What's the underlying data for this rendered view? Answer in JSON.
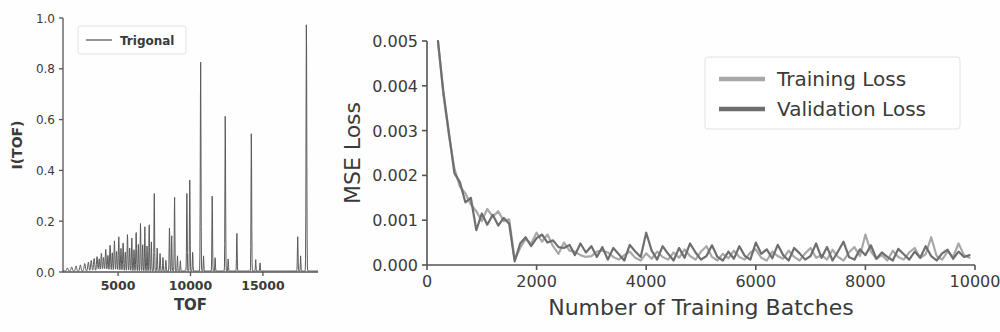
{
  "figure": {
    "background_color": "#fefefe",
    "text_color": "#3a3a3a"
  },
  "chart_data": [
    {
      "id": "tof-spectrum",
      "type": "line",
      "title": "",
      "xlabel": "TOF",
      "ylabel": "I(TOF)",
      "xlim": [
        1200,
        18800
      ],
      "ylim": [
        0.0,
        1.0
      ],
      "xticks": [
        5000,
        10000,
        15000
      ],
      "xtick_labels": [
        "5000",
        "10000",
        "15000"
      ],
      "yticks": [
        0.0,
        0.2,
        0.4,
        0.6,
        0.8,
        1.0
      ],
      "ytick_labels": [
        "0.0",
        "0.2",
        "0.4",
        "0.6",
        "0.8",
        "1.0"
      ],
      "grid": false,
      "legend_position": "upper left",
      "series": [
        {
          "name": "Trigonal",
          "color": "#5a5a5a",
          "linewidth": 1.0,
          "peaks": [
            {
              "x": 1500,
              "h": 0.012,
              "w": 60
            },
            {
              "x": 1800,
              "h": 0.016,
              "w": 60
            },
            {
              "x": 2100,
              "h": 0.02,
              "w": 60
            },
            {
              "x": 2400,
              "h": 0.024,
              "w": 60
            },
            {
              "x": 2700,
              "h": 0.03,
              "w": 60
            },
            {
              "x": 2950,
              "h": 0.035,
              "w": 55
            },
            {
              "x": 3150,
              "h": 0.042,
              "w": 55
            },
            {
              "x": 3350,
              "h": 0.05,
              "w": 55
            },
            {
              "x": 3550,
              "h": 0.058,
              "w": 50
            },
            {
              "x": 3700,
              "h": 0.048,
              "w": 45
            },
            {
              "x": 3850,
              "h": 0.07,
              "w": 45
            },
            {
              "x": 4000,
              "h": 0.055,
              "w": 45
            },
            {
              "x": 4150,
              "h": 0.085,
              "w": 45
            },
            {
              "x": 4300,
              "h": 0.062,
              "w": 42
            },
            {
              "x": 4450,
              "h": 0.105,
              "w": 42
            },
            {
              "x": 4600,
              "h": 0.072,
              "w": 40
            },
            {
              "x": 4750,
              "h": 0.12,
              "w": 40
            },
            {
              "x": 4900,
              "h": 0.08,
              "w": 40
            },
            {
              "x": 5050,
              "h": 0.135,
              "w": 38
            },
            {
              "x": 5200,
              "h": 0.09,
              "w": 38
            },
            {
              "x": 5350,
              "h": 0.115,
              "w": 38
            },
            {
              "x": 5500,
              "h": 0.075,
              "w": 36
            },
            {
              "x": 5650,
              "h": 0.145,
              "w": 36
            },
            {
              "x": 5800,
              "h": 0.095,
              "w": 36
            },
            {
              "x": 5950,
              "h": 0.13,
              "w": 34
            },
            {
              "x": 6100,
              "h": 0.085,
              "w": 34
            },
            {
              "x": 6250,
              "h": 0.16,
              "w": 34
            },
            {
              "x": 6400,
              "h": 0.105,
              "w": 32
            },
            {
              "x": 6550,
              "h": 0.19,
              "w": 32
            },
            {
              "x": 6700,
              "h": 0.11,
              "w": 32
            },
            {
              "x": 6850,
              "h": 0.175,
              "w": 30
            },
            {
              "x": 7000,
              "h": 0.1,
              "w": 30
            },
            {
              "x": 7150,
              "h": 0.195,
              "w": 30
            },
            {
              "x": 7300,
              "h": 0.115,
              "w": 30
            },
            {
              "x": 7500,
              "h": 0.305,
              "w": 30
            },
            {
              "x": 7700,
              "h": 0.09,
              "w": 30
            },
            {
              "x": 7900,
              "h": 0.07,
              "w": 30
            },
            {
              "x": 8100,
              "h": 0.055,
              "w": 30
            },
            {
              "x": 8300,
              "h": 0.045,
              "w": 30
            },
            {
              "x": 8550,
              "h": 0.175,
              "w": 30
            },
            {
              "x": 8700,
              "h": 0.145,
              "w": 28
            },
            {
              "x": 8900,
              "h": 0.295,
              "w": 30
            },
            {
              "x": 9100,
              "h": 0.06,
              "w": 28
            },
            {
              "x": 9300,
              "h": 0.04,
              "w": 28
            },
            {
              "x": 9750,
              "h": 0.305,
              "w": 30
            },
            {
              "x": 9950,
              "h": 0.36,
              "w": 30
            },
            {
              "x": 10150,
              "h": 0.075,
              "w": 28
            },
            {
              "x": 10700,
              "h": 0.835,
              "w": 32
            },
            {
              "x": 10900,
              "h": 0.06,
              "w": 26
            },
            {
              "x": 11500,
              "h": 0.3,
              "w": 30
            },
            {
              "x": 11700,
              "h": 0.055,
              "w": 26
            },
            {
              "x": 12400,
              "h": 0.62,
              "w": 30
            },
            {
              "x": 12600,
              "h": 0.05,
              "w": 26
            },
            {
              "x": 13200,
              "h": 0.155,
              "w": 28
            },
            {
              "x": 14200,
              "h": 0.55,
              "w": 30
            },
            {
              "x": 14500,
              "h": 0.045,
              "w": 26
            },
            {
              "x": 14800,
              "h": 0.035,
              "w": 26
            },
            {
              "x": 17400,
              "h": 0.135,
              "w": 30
            },
            {
              "x": 17600,
              "h": 0.06,
              "w": 26
            },
            {
              "x": 18000,
              "h": 1.0,
              "w": 34
            }
          ]
        }
      ]
    },
    {
      "id": "training-loss",
      "type": "line",
      "title": "",
      "xlabel": "Number of Training Batches",
      "ylabel": "MSE Loss",
      "xlim": [
        0,
        10000
      ],
      "ylim": [
        0.0,
        0.005
      ],
      "xticks": [
        0,
        2000,
        4000,
        6000,
        8000,
        10000
      ],
      "xtick_labels": [
        "0",
        "2000",
        "4000",
        "6000",
        "8000",
        "10000"
      ],
      "yticks": [
        0.0,
        0.001,
        0.002,
        0.003,
        0.004,
        0.005
      ],
      "ytick_labels": [
        "0.000",
        "0.001",
        "0.002",
        "0.003",
        "0.004",
        "0.005"
      ],
      "grid": false,
      "legend_position": "upper right",
      "series": [
        {
          "name": "Training Loss",
          "color": "#a8a8a8",
          "linewidth": 2.2,
          "x": [
            200,
            300,
            400,
            500,
            600,
            700,
            800,
            900,
            1000,
            1100,
            1200,
            1300,
            1400,
            1500,
            1600,
            1700,
            1800,
            1900,
            2000,
            2100,
            2200,
            2300,
            2400,
            2500,
            2600,
            2700,
            2800,
            2900,
            3000,
            3100,
            3200,
            3300,
            3400,
            3500,
            3600,
            3700,
            3800,
            3900,
            4000,
            4100,
            4200,
            4300,
            4400,
            4500,
            4600,
            4700,
            4800,
            4900,
            5000,
            5100,
            5200,
            5300,
            5400,
            5500,
            5600,
            5700,
            5800,
            5900,
            6000,
            6100,
            6200,
            6300,
            6400,
            6500,
            6600,
            6700,
            6800,
            6900,
            7000,
            7100,
            7200,
            7300,
            7400,
            7500,
            7600,
            7700,
            7800,
            7900,
            8000,
            8100,
            8200,
            8300,
            8400,
            8500,
            8600,
            8700,
            8800,
            8900,
            9000,
            9100,
            9200,
            9300,
            9400,
            9500,
            9600,
            9700,
            9800,
            9900
          ],
          "y": [
            0.005,
            0.0038,
            0.0029,
            0.00215,
            0.00175,
            0.0016,
            0.00135,
            0.0012,
            0.00098,
            0.00125,
            0.00108,
            0.0012,
            0.00098,
            0.00102,
            0.00012,
            0.00038,
            0.00058,
            0.00048,
            0.00072,
            0.00052,
            0.00068,
            0.00042,
            0.00025,
            0.0005,
            0.00032,
            0.0003,
            0.00022,
            0.00018,
            0.0002,
            0.0003,
            0.00032,
            0.00028,
            0.00018,
            0.00012,
            0.00022,
            0.0003,
            0.00016,
            0.0001,
            0.00026,
            0.00014,
            0.0003,
            0.00018,
            0.00012,
            0.00028,
            0.00016,
            0.00035,
            0.0002,
            0.00012,
            0.0003,
            0.00042,
            0.00018,
            0.0001,
            0.00025,
            0.00015,
            0.00032,
            0.00018,
            0.00012,
            0.00028,
            0.00035,
            0.00016,
            0.0001,
            0.0003,
            0.0002,
            0.00014,
            0.00032,
            0.00018,
            0.0001,
            0.00026,
            0.00038,
            0.00016,
            0.00022,
            0.00012,
            0.00034,
            0.00018,
            0.0001,
            0.00028,
            0.0004,
            0.0002,
            0.00068,
            0.0003,
            0.00014,
            0.00022,
            0.0001,
            0.00032,
            0.00018,
            0.00012,
            0.00028,
            0.00038,
            0.00016,
            0.00024,
            0.00062,
            0.0002,
            0.00012,
            0.0003,
            0.00018,
            0.00048,
            0.00022,
            0.00016,
            0.0002
          ]
        },
        {
          "name": "Validation Loss",
          "color": "#6e6e6e",
          "linewidth": 2.2,
          "x": [
            200,
            300,
            400,
            500,
            600,
            700,
            800,
            900,
            1000,
            1100,
            1200,
            1300,
            1400,
            1500,
            1600,
            1700,
            1800,
            1900,
            2000,
            2100,
            2200,
            2300,
            2400,
            2500,
            2600,
            2700,
            2800,
            2900,
            3000,
            3100,
            3200,
            3300,
            3400,
            3500,
            3600,
            3700,
            3800,
            3900,
            4000,
            4100,
            4200,
            4300,
            4400,
            4500,
            4600,
            4700,
            4800,
            4900,
            5000,
            5100,
            5200,
            5300,
            5400,
            5500,
            5600,
            5700,
            5800,
            5900,
            6000,
            6100,
            6200,
            6300,
            6400,
            6500,
            6600,
            6700,
            6800,
            6900,
            7000,
            7100,
            7200,
            7300,
            7400,
            7500,
            7600,
            7700,
            7800,
            7900,
            8000,
            8100,
            8200,
            8300,
            8400,
            8500,
            8600,
            8700,
            8800,
            8900,
            9000,
            9100,
            9200,
            9300,
            9400,
            9500,
            9600,
            9700,
            9800,
            9900
          ],
          "y": [
            0.005,
            0.00385,
            0.00295,
            0.00205,
            0.00185,
            0.0014,
            0.0015,
            0.00078,
            0.00115,
            0.0009,
            0.00112,
            0.00088,
            0.00105,
            0.00092,
            8e-05,
            0.00048,
            0.00062,
            0.00042,
            0.0006,
            0.00068,
            0.0005,
            0.00055,
            0.0004,
            0.00038,
            0.00045,
            0.00022,
            0.00048,
            0.00028,
            0.00042,
            0.00018,
            0.0004,
            0.00012,
            0.00038,
            0.00024,
            0.0001,
            0.00045,
            0.0003,
            0.00018,
            0.00072,
            0.00032,
            0.00012,
            0.00042,
            0.00025,
            0.0001,
            0.00038,
            0.00016,
            0.00048,
            0.00028,
            0.00012,
            0.0002,
            0.00044,
            0.00018,
            0.0001,
            0.0003,
            0.00014,
            0.00042,
            0.0002,
            0.00012,
            0.0005,
            0.00025,
            0.00035,
            0.00015,
            0.00045,
            0.00022,
            0.0001,
            0.00038,
            0.00026,
            0.00012,
            0.0002,
            0.00048,
            0.00016,
            0.0004,
            0.0001,
            0.0003,
            0.00052,
            0.00018,
            0.00012,
            0.00035,
            0.00022,
            0.00044,
            0.00014,
            0.00028,
            0.00018,
            0.0001,
            0.00036,
            0.00024,
            0.00012,
            0.0003,
            0.00016,
            0.00042,
            0.0002,
            0.0001,
            0.00026,
            0.00034,
            0.00014,
            0.0003,
            0.00018,
            0.00022
          ]
        }
      ]
    }
  ]
}
